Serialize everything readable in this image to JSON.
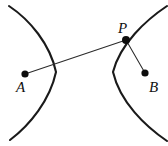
{
  "figure": {
    "background_color": "#ffffff",
    "stroke_color": "#1a1a1a",
    "line_color": "#2b2b2b",
    "dot_color": "#0d0d0d",
    "width": 168,
    "height": 146
  },
  "labels": {
    "a": "A",
    "p": "P",
    "b": "B"
  },
  "geometry": {
    "points": [
      {
        "name": "A",
        "x": 25,
        "y": 74,
        "radius": 3.6,
        "label_x": 16,
        "label_y": 92
      },
      {
        "name": "P",
        "x": 126,
        "y": 40,
        "radius": 4.0,
        "label_x": 118,
        "label_y": 33
      },
      {
        "name": "B",
        "x": 145,
        "y": 73,
        "radius": 3.6,
        "label_x": 149,
        "label_y": 92
      }
    ],
    "segments": [
      {
        "name": "segment-AP",
        "from": "A",
        "to": "P",
        "x1": 25,
        "y1": 74,
        "x2": 126,
        "y2": 40
      },
      {
        "name": "segment-PB",
        "from": "P",
        "to": "B",
        "x1": 126,
        "y1": 40,
        "x2": 145,
        "y2": 73
      }
    ],
    "curves": [
      {
        "name": "left-branch",
        "opens": "left",
        "path": "M 9 6 C 30 20 50 44 56 72 C 50 100 30 125 10 140",
        "vertex_x": 56,
        "vertex_y": 72
      },
      {
        "name": "right-branch",
        "opens": "right",
        "path": "M 167 6 C 146 20 120 44 113 72 C 120 102 145 126 167 141",
        "vertex_x": 113,
        "vertex_y": 72
      }
    ]
  }
}
